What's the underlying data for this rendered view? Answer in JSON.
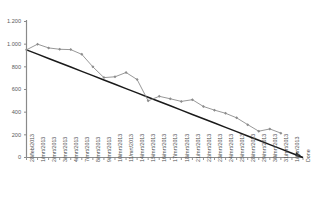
{
  "chart_data": {
    "type": "line",
    "title": "",
    "subtitle": "",
    "xlabel": "",
    "ylabel": "",
    "ylim": [
      0,
      1200
    ],
    "yticks": [
      0,
      200,
      400,
      600,
      800,
      1000,
      1200
    ],
    "ytick_labels": [
      "0",
      "200",
      "400",
      "600",
      "800",
      "1.000",
      "1.200"
    ],
    "grid": false,
    "legend": "none",
    "categories": [
      "28/feb/2013",
      "1/mrt/2013",
      "2/mrt/2013",
      "3/mrt/2013",
      "4/mrt/2013",
      "7/mrt/2013",
      "8/mrt/2013",
      "9/mrt/2013",
      "10/mrt/2013",
      "11/mrt/2013",
      "14/mrt/2013",
      "15/mrt/2013",
      "16/mrt/2013",
      "17/mrt/2013",
      "18/mrt/2013",
      "21/mrt/2013",
      "22/mrt/2013",
      "23/mrt/2013",
      "24/mrt/2013",
      "25/mrt/2013",
      "28/mrt/2013",
      "29/mrt/2013",
      "30/mrt/2013",
      "31/mrt/2013",
      "1/apr/2013",
      "Done"
    ],
    "series": [
      {
        "name": "ideal",
        "color": "#1a1a1a",
        "markers": false,
        "values": [
          950,
          912,
          874,
          836,
          798,
          760,
          722,
          684,
          646,
          608,
          570,
          532,
          494,
          456,
          418,
          380,
          342,
          304,
          266,
          228,
          190,
          152,
          114,
          76,
          38,
          0
        ]
      },
      {
        "name": "actual",
        "color": "#8c8c8c",
        "markers": true,
        "values": [
          950,
          1000,
          967,
          955,
          952,
          910,
          800,
          705,
          712,
          750,
          688,
          500,
          540,
          518,
          495,
          510,
          450,
          418,
          390,
          350,
          290,
          232,
          252,
          215,
          null,
          null
        ]
      }
    ]
  }
}
